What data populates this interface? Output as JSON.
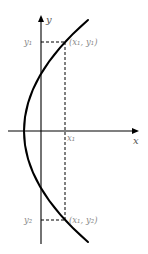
{
  "figure": {
    "type": "sideways-parabola-graph",
    "axes": {
      "x_label": "x",
      "y_label": "y"
    },
    "curve": {
      "description": "parabola opening to the right",
      "vertex_px": [
        24,
        131
      ]
    },
    "points": [
      {
        "label": "(x₁, y₁)",
        "x_name": "x₁",
        "y_name": "y₁"
      },
      {
        "label": "(x₁, y₂)",
        "x_name": "x₁",
        "y_name": "y₂"
      }
    ],
    "tick_labels": {
      "x1": "x₁",
      "y1": "y₁",
      "y2": "y₂"
    },
    "colors": {
      "lines": "#000000",
      "labels": "#8a8a8a",
      "background": "#ffffff"
    }
  }
}
